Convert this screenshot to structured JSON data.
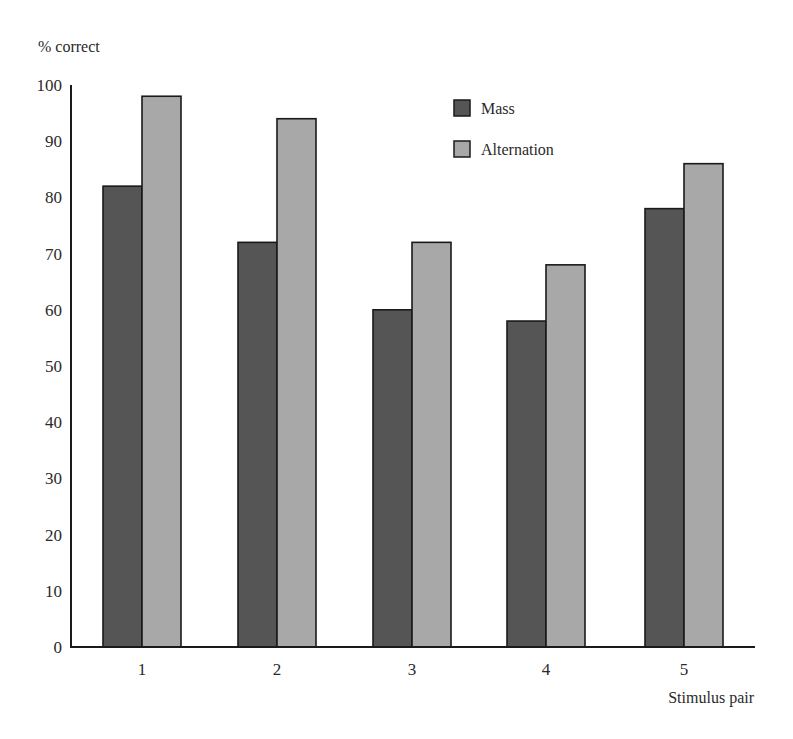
{
  "chart_data": {
    "type": "bar",
    "title": "",
    "xlabel": "Stimulus pair",
    "ylabel": "% correct",
    "ylim": [
      0,
      100
    ],
    "yticks": [
      0,
      10,
      20,
      30,
      40,
      50,
      60,
      70,
      80,
      90,
      100
    ],
    "categories": [
      "1",
      "2",
      "3",
      "4",
      "5"
    ],
    "series": [
      {
        "name": "Mass",
        "color": "#555555",
        "values": [
          82,
          72,
          60,
          58,
          78
        ]
      },
      {
        "name": "Alternation",
        "color": "#a8a8a8",
        "values": [
          98,
          94,
          72,
          68,
          86
        ]
      }
    ],
    "grid": false,
    "legend_position": "top-center-right"
  },
  "labels": {
    "y_axis_title": "% correct",
    "x_axis_title": "Stimulus pair",
    "legend": [
      "Mass",
      "Alternation"
    ]
  }
}
